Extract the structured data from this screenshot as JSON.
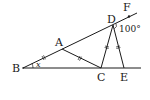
{
  "diagram": {
    "points": {
      "B": {
        "label": "B",
        "x": 23,
        "y": 68
      },
      "A": {
        "label": "A",
        "x": 62,
        "y": 49
      },
      "D": {
        "label": "D",
        "x": 113,
        "y": 25
      },
      "F": {
        "label": "F",
        "x": 129,
        "y": 15
      },
      "C": {
        "label": "C",
        "x": 101,
        "y": 68
      },
      "E": {
        "label": "E",
        "x": 124,
        "y": 68
      }
    },
    "angle_at_B": "x",
    "angle_at_D": "100°",
    "colors": {
      "stroke": "#1a1a1a",
      "background": "#ffffff"
    }
  }
}
